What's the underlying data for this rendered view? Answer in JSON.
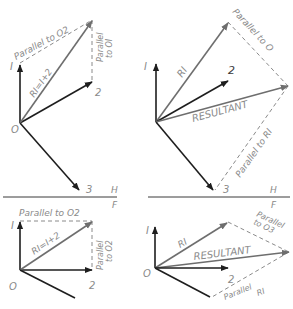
{
  "figure": {
    "panels": [
      {
        "id": "top-left",
        "view": "H",
        "labels": {
          "origin": "O",
          "v1": "I",
          "v2": "2",
          "v3": "3",
          "r1": "RI=I+2",
          "parallel_top": "Parallel to O2",
          "parallel_side_1": "Parallel",
          "parallel_side_2": "to OI"
        }
      },
      {
        "id": "top-right",
        "view": "H",
        "labels": {
          "origin": "O",
          "v1": "I",
          "v2": "2",
          "v3": "3",
          "r1": "RI",
          "resultant": "RESULTANT",
          "parallel_top": "Parallel to O",
          "parallel_bottom": "Parallel to RI"
        }
      },
      {
        "id": "bottom-left",
        "view": "F",
        "labels": {
          "origin": "O",
          "v1": "I",
          "v2": "2",
          "r1": "RI=I+2",
          "parallel_top": "Parallel to O2",
          "parallel_side_1": "Parallel",
          "parallel_side_2": "to O2"
        }
      },
      {
        "id": "bottom-right",
        "view": "F",
        "labels": {
          "origin": "O",
          "v1": "I",
          "v2": "2",
          "r1": "RI",
          "resultant": "RESULTANT",
          "parallel_top_1": "Parallel",
          "parallel_top_2": "to O3",
          "parallel_bottom_1": "Parallel",
          "parallel_bottom_2": "RI"
        }
      }
    ],
    "fold_lines": [
      {
        "upper": "H",
        "lower": "F"
      },
      {
        "upper": "H",
        "lower": "F"
      }
    ],
    "colors": {
      "vector": "#1e1e1e",
      "resultant": "#6e6e6e",
      "dashed": "#8a8a8a",
      "label": "#8a8a8a"
    }
  }
}
